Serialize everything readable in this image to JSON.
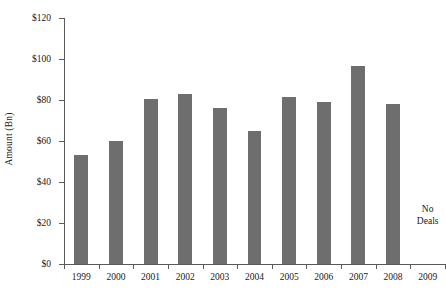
{
  "chart_data": {
    "type": "bar",
    "title": "",
    "xlabel": "",
    "ylabel": "Amount (Bn)",
    "categories": [
      "1999",
      "2000",
      "2001",
      "2002",
      "2003",
      "2004",
      "2005",
      "2006",
      "2007",
      "2008",
      "2009"
    ],
    "values": [
      53,
      60,
      80.5,
      83,
      76,
      65,
      81.5,
      79,
      96.5,
      78,
      null
    ],
    "ylim": [
      0,
      120
    ],
    "ytick_step": 20,
    "ytick_labels": [
      "$0",
      "$20",
      "$40",
      "$60",
      "$80",
      "$100",
      "$120"
    ],
    "ytick_values": [
      0,
      20,
      40,
      60,
      80,
      100,
      120
    ],
    "grid": false,
    "legend": "none",
    "bar_color": "#6e6e6e",
    "axis_color": "#5a5a5a",
    "annotations": [
      {
        "name": "no-deals",
        "category": "2009",
        "text_line1": "No",
        "text_line2": "Deals"
      }
    ]
  }
}
